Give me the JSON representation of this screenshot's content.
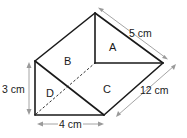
{
  "diagram": {
    "type": "triangular-prism-net-3d",
    "faces": [
      {
        "id": "A",
        "label": "A"
      },
      {
        "id": "B",
        "label": "B"
      },
      {
        "id": "C",
        "label": "C"
      },
      {
        "id": "D",
        "label": "D"
      }
    ],
    "dimensions": {
      "height": "3 cm",
      "base": "4 cm",
      "slant": "5 cm",
      "length": "12 cm"
    },
    "colors": {
      "edge": "#1a1a1a",
      "dimension_line": "#9a9a9a",
      "background": "#ffffff"
    }
  }
}
